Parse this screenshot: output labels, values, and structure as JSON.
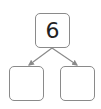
{
  "diagram": {
    "type": "number-bond",
    "whole": "6",
    "parts": [
      "",
      ""
    ],
    "colors": {
      "border": "#8a8a8a",
      "arrow": "#8a8a8a",
      "text": "#222222"
    }
  }
}
